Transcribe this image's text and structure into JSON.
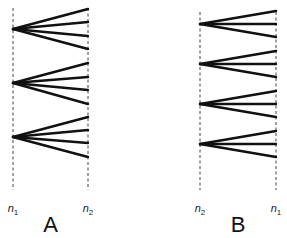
{
  "diagram": {
    "panels": [
      {
        "id": "A",
        "label": "A",
        "left_axis": {
          "name": "n",
          "sub": "1",
          "x": 13
        },
        "right_axis": {
          "name": "n",
          "sub": "2",
          "x": 88
        },
        "axis_top": 8,
        "axis_bottom": 190,
        "fans": [
          {
            "origin_y": 29,
            "ends_y": [
              9,
              22,
              36,
              49
            ]
          },
          {
            "origin_y": 83,
            "ends_y": [
              63,
              77,
              90,
              104
            ]
          },
          {
            "origin_y": 137,
            "ends_y": [
              117,
              130,
              143,
              157
            ]
          }
        ]
      },
      {
        "id": "B",
        "label": "B",
        "left_axis": {
          "name": "n",
          "sub": "2",
          "x": 200
        },
        "right_axis": {
          "name": "n",
          "sub": "1",
          "x": 276
        },
        "axis_top": 12,
        "axis_bottom": 190,
        "fans": [
          {
            "origin_y": 24,
            "ends_y": [
              11,
              24,
              37
            ]
          },
          {
            "origin_y": 64,
            "ends_y": [
              51,
              64,
              77
            ]
          },
          {
            "origin_y": 104,
            "ends_y": [
              91,
              104,
              117
            ]
          },
          {
            "origin_y": 144,
            "ends_y": [
              131,
              144,
              157
            ]
          }
        ]
      }
    ],
    "axis_label_y": 203,
    "panel_label_y": 214
  }
}
